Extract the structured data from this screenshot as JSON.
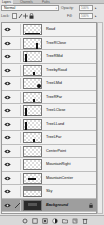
{
  "panel": {
    "tabs": [
      {
        "label": "Layers",
        "active": true
      },
      {
        "label": "Channels",
        "active": false
      },
      {
        "label": "Paths",
        "active": false
      }
    ],
    "blend_mode": "Normal",
    "opacity_label": "Opacity:",
    "opacity_value": "100%",
    "lock_label": "Lock:",
    "fill_label": "Fill:",
    "fill_value": "100%"
  },
  "layers": [
    {
      "name": "Road",
      "visible": true,
      "selected": false,
      "thumb": "road"
    },
    {
      "name": "TreeRClose",
      "visible": true,
      "selected": false,
      "thumb": "tree-right"
    },
    {
      "name": "TreeRMid",
      "visible": true,
      "selected": false,
      "thumb": "tree-left"
    },
    {
      "name": "TreebyRoad",
      "visible": true,
      "selected": false,
      "thumb": "tree-small"
    },
    {
      "name": "TreeLMid",
      "visible": true,
      "selected": false,
      "thumb": "tree-blob"
    },
    {
      "name": "TreeRFar",
      "visible": true,
      "selected": false,
      "thumb": "tree-small"
    },
    {
      "name": "TreeLClose",
      "visible": true,
      "selected": false,
      "thumb": "tree-left"
    },
    {
      "name": "TreeLLand",
      "visible": true,
      "selected": false,
      "thumb": "tree-left"
    },
    {
      "name": "TreeLFar",
      "visible": true,
      "selected": false,
      "thumb": "tree-small"
    },
    {
      "name": "CenterPoint",
      "visible": true,
      "selected": false,
      "thumb": "empty"
    },
    {
      "name": "MountainRight",
      "visible": true,
      "selected": false,
      "thumb": "empty"
    },
    {
      "name": "MountainCenter",
      "visible": true,
      "selected": false,
      "thumb": "mountain"
    },
    {
      "name": "Sky",
      "visible": true,
      "selected": false,
      "thumb": "sky"
    },
    {
      "name": "Background",
      "visible": true,
      "selected": true,
      "thumb": "dark",
      "locked": true
    }
  ],
  "bottom_bar": {
    "buttons": [
      "link-layers",
      "layer-style",
      "add-mask",
      "adjustment-layer",
      "new-group",
      "new-layer",
      "delete-layer"
    ]
  },
  "colors": {
    "panel_bg": "#e4e4e4",
    "selected_row": "#9e9e9e"
  }
}
